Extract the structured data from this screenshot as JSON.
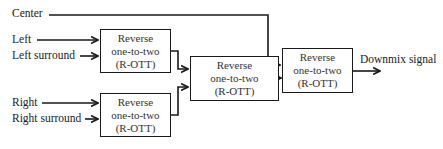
{
  "inputs": {
    "center": "Center",
    "left": "Left",
    "left_surround": "Left surround",
    "right": "Right",
    "right_surround": "Right surround"
  },
  "blocks": [
    {
      "line1": "Reverse",
      "line2": "one-to-two",
      "line3": "(R-OTT)"
    },
    {
      "line1": "Reverse",
      "line2": "one-to-two",
      "line3": "(R-OTT)"
    },
    {
      "line1": "Reverse",
      "line2": "one-to-two",
      "line3": "(R-OTT)"
    },
    {
      "line1": "Reverse",
      "line2": "one-to-two",
      "line3": "(R-OTT)"
    }
  ],
  "output": "Downmix signal"
}
